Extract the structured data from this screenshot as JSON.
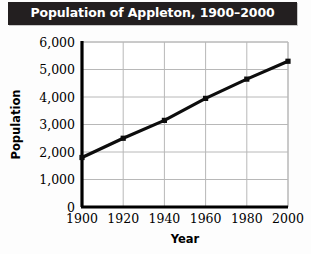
{
  "title": "Population of Appleton, 1900–2000",
  "colors": {
    "title_bar_bg": "#231f20",
    "title_text": "#ffffff",
    "page_bg": "#fdfdfd",
    "axis": "#000000",
    "gridline": "#b8b8b8",
    "series_line": "#0d0d0d",
    "marker": "#0d0d0d"
  },
  "axes": {
    "x_title": "Year",
    "y_title": "Population",
    "x_ticks": [
      "1900",
      "1920",
      "1940",
      "1960",
      "1980",
      "2000"
    ],
    "y_ticks": [
      "0",
      "1,000",
      "2,000",
      "3,000",
      "4,000",
      "5,000",
      "6,000"
    ]
  },
  "chart_data": {
    "type": "line",
    "title": "Population of Appleton, 1900–2000",
    "subtitle": "",
    "xlabel": "Year",
    "ylabel": "Population",
    "x": [
      1900,
      1920,
      1940,
      1960,
      1980,
      2000
    ],
    "categories": [
      "1900",
      "1920",
      "1940",
      "1960",
      "1980",
      "2000"
    ],
    "values": [
      1800,
      2500,
      3150,
      3950,
      4650,
      5300
    ],
    "series": [
      {
        "name": "Population",
        "values": [
          1800,
          2500,
          3150,
          3950,
          4650,
          5300
        ]
      }
    ],
    "xlim": [
      1900,
      2000
    ],
    "ylim": [
      0,
      6000
    ],
    "x_ticks": [
      1900,
      1920,
      1940,
      1960,
      1980,
      2000
    ],
    "y_ticks": [
      0,
      1000,
      2000,
      3000,
      4000,
      5000,
      6000
    ],
    "y_tick_labels": [
      "0",
      "1,000",
      "2,000",
      "3,000",
      "4,000",
      "5,000",
      "6,000"
    ],
    "x_tick_labels": [
      "1900",
      "1920",
      "1940",
      "1960",
      "1980",
      "2000"
    ],
    "grid": true,
    "grid_axis": "both",
    "legend": false,
    "legend_position": "none",
    "markers": "square",
    "annotations": []
  }
}
